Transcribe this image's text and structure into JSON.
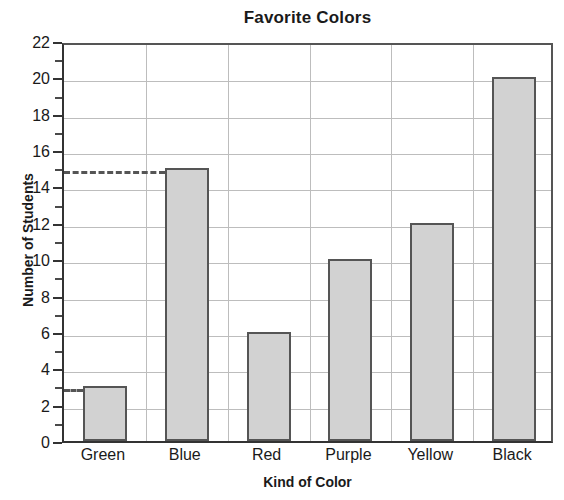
{
  "chart_data": {
    "type": "bar",
    "title": "Favorite Colors",
    "xlabel": "Kind of Color",
    "ylabel": "Number of Students",
    "categories": [
      "Green",
      "Blue",
      "Red",
      "Purple",
      "Yellow",
      "Black"
    ],
    "values": [
      3,
      15,
      6,
      10,
      12,
      20
    ],
    "ylim": [
      0,
      22
    ],
    "y_major_ticks": [
      0,
      2,
      4,
      6,
      8,
      10,
      12,
      14,
      16,
      18,
      20,
      22
    ],
    "y_tick_labels": [
      "0",
      "2",
      "4",
      "6",
      "8",
      "10",
      "12",
      "14",
      "16",
      "18",
      "20",
      "22"
    ],
    "y_minor_ticks": [
      1,
      3,
      5,
      7,
      9,
      11,
      13,
      15,
      17,
      19,
      21
    ],
    "grid": true,
    "grid_axes": "both",
    "legend": "none",
    "annotations": [
      {
        "kind": "dashed-reference-line",
        "value": 15,
        "to_category": "Blue"
      },
      {
        "kind": "dashed-reference-line",
        "value": 3,
        "to_category": "Green"
      }
    ],
    "colors": {
      "bar_fill": "#d2d2d2",
      "bar_border": "#555555",
      "gridline": "#bdbdbd",
      "axis": "#333333",
      "text": "#1a1a1a",
      "background": "#ffffff"
    }
  }
}
